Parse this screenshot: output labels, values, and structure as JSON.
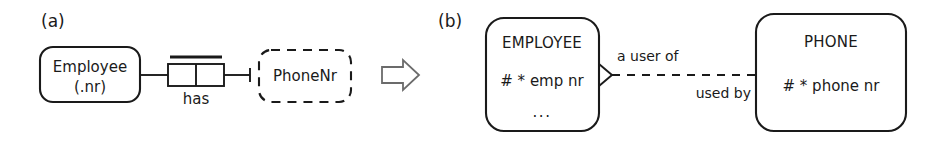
{
  "figure": {
    "panels": [
      {
        "id": "a",
        "label": "(a)",
        "notation": "ORM",
        "object_types": [
          {
            "name": "entity-type",
            "line1": "Employee",
            "line2": "(.nr)",
            "border": "solid"
          },
          {
            "name": "value-type",
            "line1": "PhoneNr",
            "line2": "",
            "border": "dashed"
          }
        ],
        "fact_type": {
          "predicate_label": "has",
          "roles": 2,
          "uniqueness_constraint": "spanning"
        }
      },
      {
        "id": "b",
        "label": "(b)",
        "notation": "Barker ER",
        "entities": [
          {
            "name": "EMPLOYEE",
            "attributes": [
              "# *  emp nr",
              "..."
            ]
          },
          {
            "name": "PHONE",
            "attributes": [
              "# *  phone nr"
            ]
          }
        ],
        "relationship": {
          "label_top": "a user of",
          "label_bottom": "used by",
          "line_style": "dashed",
          "end_marker": "crows-foot"
        }
      }
    ],
    "transform_arrow": {
      "name": "transform-arrow",
      "direction": "right",
      "glyph": "⇒"
    },
    "colors": {
      "ink": "#1a1a1a",
      "arrow_outline": "#6b6b6b",
      "background": "#ffffff"
    }
  }
}
